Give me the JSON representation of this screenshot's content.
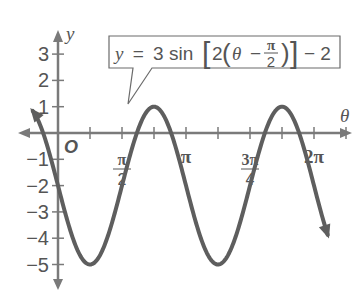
{
  "chart_data": {
    "type": "line",
    "title": "",
    "equation": {
      "lhs": "y",
      "eq": "=",
      "coef": "3 sin",
      "inner_coef": "2",
      "var": "θ",
      "minus": "−",
      "frac_num": "π",
      "frac_den": "2",
      "tail": "− 2"
    },
    "xlabel": "θ",
    "ylabel": "y",
    "origin_label": "O",
    "x_ticks": [
      {
        "label_num": "π",
        "label_den": "2",
        "value": 1.5708
      },
      {
        "label": "π",
        "value": 3.1416
      },
      {
        "label_num": "3π",
        "label_den": "4",
        "value": 4.7124
      },
      {
        "label": "2π",
        "value": 6.2832
      }
    ],
    "y_ticks": [
      "3",
      "2",
      "1",
      "−1",
      "−2",
      "−3",
      "−4",
      "−5"
    ],
    "y_tick_values": [
      3,
      2,
      1,
      -1,
      -2,
      -3,
      -4,
      -5
    ],
    "xlim": [
      -1.3,
      6.7
    ],
    "ylim": [
      -5.5,
      3.6
    ],
    "series": [
      {
        "name": "y = 3 sin[2(θ − π/2)] − 2",
        "function": "3*sin(2*(t - pi/2)) - 2",
        "x": [
          -0.785,
          0,
          0.785,
          1.571,
          2.356,
          3.142,
          3.927,
          4.712,
          5.498,
          6.283,
          6.6
        ],
        "values": [
          -2,
          -5,
          -2,
          1,
          -2,
          -5,
          -2,
          1,
          -2,
          -5,
          -3.8
        ],
        "max": 1,
        "min": -5,
        "period": 3.1416,
        "amplitude": 3
      }
    ],
    "grid": false,
    "legend": "callout box"
  }
}
